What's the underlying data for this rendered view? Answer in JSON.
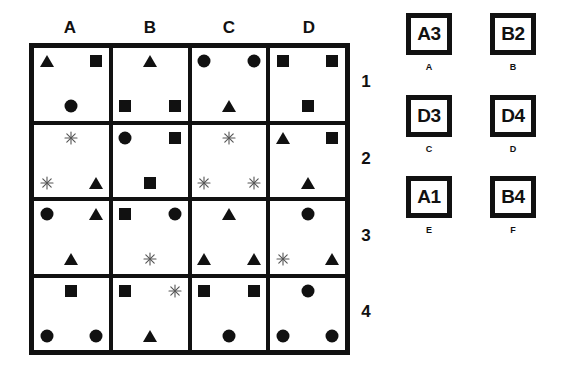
{
  "puzzle": {
    "columns": [
      "A",
      "B",
      "C",
      "D"
    ],
    "rows": [
      "1",
      "2",
      "3",
      "4"
    ],
    "cells": [
      [
        {
          "id": "A1",
          "shapes": [
            {
              "type": "triangle",
              "pos": "tl"
            },
            {
              "type": "square",
              "pos": "tr"
            },
            {
              "type": "circle",
              "pos": "bc"
            }
          ]
        },
        {
          "id": "B1",
          "shapes": [
            {
              "type": "triangle",
              "pos": "tc"
            },
            {
              "type": "square",
              "pos": "bl"
            },
            {
              "type": "square",
              "pos": "br"
            }
          ]
        },
        {
          "id": "C1",
          "shapes": [
            {
              "type": "circle",
              "pos": "tl"
            },
            {
              "type": "circle",
              "pos": "tr"
            },
            {
              "type": "triangle",
              "pos": "bc"
            }
          ]
        },
        {
          "id": "D1",
          "shapes": [
            {
              "type": "square",
              "pos": "tl"
            },
            {
              "type": "square",
              "pos": "tr"
            },
            {
              "type": "square",
              "pos": "bc"
            }
          ]
        }
      ],
      [
        {
          "id": "A2",
          "shapes": [
            {
              "type": "star",
              "pos": "tc"
            },
            {
              "type": "star",
              "pos": "bl"
            },
            {
              "type": "triangle",
              "pos": "br"
            }
          ]
        },
        {
          "id": "B2",
          "shapes": [
            {
              "type": "circle",
              "pos": "tl"
            },
            {
              "type": "square",
              "pos": "tr"
            },
            {
              "type": "square",
              "pos": "bc"
            }
          ]
        },
        {
          "id": "C2",
          "shapes": [
            {
              "type": "star",
              "pos": "tc"
            },
            {
              "type": "star",
              "pos": "bl"
            },
            {
              "type": "star",
              "pos": "br"
            }
          ]
        },
        {
          "id": "D2",
          "shapes": [
            {
              "type": "triangle",
              "pos": "tl"
            },
            {
              "type": "square",
              "pos": "tr"
            },
            {
              "type": "triangle",
              "pos": "bc"
            }
          ]
        }
      ],
      [
        {
          "id": "A3",
          "shapes": [
            {
              "type": "circle",
              "pos": "tl"
            },
            {
              "type": "triangle",
              "pos": "tr"
            },
            {
              "type": "triangle",
              "pos": "bc"
            }
          ]
        },
        {
          "id": "B3",
          "shapes": [
            {
              "type": "square",
              "pos": "tl"
            },
            {
              "type": "circle",
              "pos": "tr"
            },
            {
              "type": "star",
              "pos": "bc"
            }
          ]
        },
        {
          "id": "C3",
          "shapes": [
            {
              "type": "triangle",
              "pos": "tc"
            },
            {
              "type": "triangle",
              "pos": "bl"
            },
            {
              "type": "triangle",
              "pos": "br"
            }
          ]
        },
        {
          "id": "D3",
          "shapes": [
            {
              "type": "circle",
              "pos": "tc"
            },
            {
              "type": "star",
              "pos": "bl"
            },
            {
              "type": "triangle",
              "pos": "br"
            }
          ]
        }
      ],
      [
        {
          "id": "A4",
          "shapes": [
            {
              "type": "square",
              "pos": "tc"
            },
            {
              "type": "circle",
              "pos": "bl"
            },
            {
              "type": "circle",
              "pos": "br"
            }
          ]
        },
        {
          "id": "B4",
          "shapes": [
            {
              "type": "square",
              "pos": "tl"
            },
            {
              "type": "star",
              "pos": "tr"
            },
            {
              "type": "triangle",
              "pos": "bc"
            }
          ]
        },
        {
          "id": "C4",
          "shapes": [
            {
              "type": "square",
              "pos": "tl"
            },
            {
              "type": "square",
              "pos": "tr"
            },
            {
              "type": "circle",
              "pos": "bc"
            }
          ]
        },
        {
          "id": "D4",
          "shapes": [
            {
              "type": "circle",
              "pos": "tc"
            },
            {
              "type": "circle",
              "pos": "bl"
            },
            {
              "type": "circle",
              "pos": "br"
            }
          ]
        }
      ]
    ]
  },
  "options": [
    {
      "letter": "A",
      "value": "A3"
    },
    {
      "letter": "B",
      "value": "B2"
    },
    {
      "letter": "C",
      "value": "D3"
    },
    {
      "letter": "D",
      "value": "D4"
    },
    {
      "letter": "E",
      "value": "A1"
    },
    {
      "letter": "F",
      "value": "B4"
    }
  ],
  "colors": {
    "ink": "#111111",
    "star": "#555555",
    "background": "#ffffff"
  }
}
